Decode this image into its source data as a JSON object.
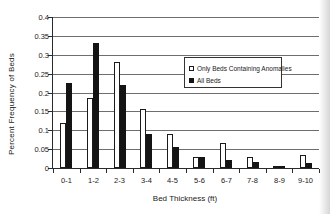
{
  "figure": {
    "background": "#ffffff",
    "ink_color": "#1a1a1a",
    "gridline_color": "#6e6e6e",
    "axis_color": "#2a2a2a",
    "scan_shadow_color": "#b4b4b4"
  },
  "chart_data": {
    "type": "bar",
    "title": "",
    "xlabel": "Bed Thickness (ft)",
    "ylabel": "Percent Frequency of Beds",
    "categories": [
      "0-1",
      "1-2",
      "2-3",
      "3-4",
      "4-5",
      "5-6",
      "6-7",
      "7-8",
      "8-9",
      "9-10"
    ],
    "series": [
      {
        "name": "Only Beds Containing Anomalies",
        "fill": "#ffffff",
        "border": "#1a1a1a",
        "values": [
          0.12,
          0.185,
          0.28,
          0.155,
          0.09,
          0.03,
          0.065,
          0.03,
          0.003,
          0.035
        ]
      },
      {
        "name": "All Beds",
        "fill": "#141414",
        "border": "#141414",
        "values": [
          0.225,
          0.33,
          0.22,
          0.09,
          0.055,
          0.03,
          0.02,
          0.015,
          0.006,
          0.012
        ]
      }
    ],
    "ylim": [
      0,
      0.4
    ],
    "ytick_labels": [
      "0",
      "0.05",
      "0.1",
      "0.15",
      "0.2",
      "0.25",
      "0.3",
      "0.35",
      "0.4"
    ],
    "grid": true,
    "legend_position": "inside-top-right"
  }
}
